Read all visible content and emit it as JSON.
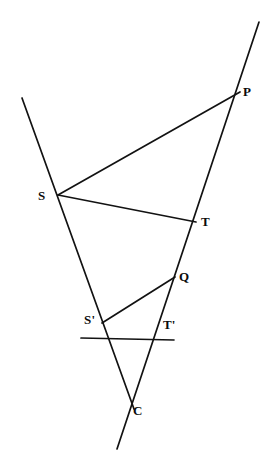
{
  "figure": {
    "background_color": "#ffffff",
    "stroke_color": "#121212",
    "label_color": "#0b0b0b",
    "width": 275,
    "height": 465
  },
  "labels": [
    {
      "id": "P",
      "text": "P",
      "x": 243,
      "y": 85,
      "anchor_x": 240,
      "anchor_y": 92
    },
    {
      "id": "S",
      "text": "S",
      "x": 38,
      "y": 189,
      "anchor_x": 58,
      "anchor_y": 195
    },
    {
      "id": "T",
      "text": "T",
      "x": 201,
      "y": 215,
      "anchor_x": 196,
      "anchor_y": 222
    },
    {
      "id": "Q",
      "text": "Q",
      "x": 179,
      "y": 270,
      "anchor_x": 175,
      "anchor_y": 277
    },
    {
      "id": "Sp",
      "text": "S'",
      "x": 84,
      "y": 313,
      "anchor_x": 102,
      "anchor_y": 323
    },
    {
      "id": "Tp",
      "text": "T'",
      "x": 163,
      "y": 318,
      "anchor_x": 158,
      "anchor_y": 331
    },
    {
      "id": "C",
      "text": "C",
      "x": 133,
      "y": 404,
      "anchor_x": 130,
      "anchor_y": 400
    }
  ],
  "points": {
    "P": {
      "x": 240,
      "y": 92
    },
    "S": {
      "x": 58,
      "y": 195
    },
    "T": {
      "x": 196,
      "y": 222
    },
    "Q": {
      "x": 175,
      "y": 277
    },
    "Sp": {
      "x": 102,
      "y": 323
    },
    "Tp": {
      "x": 158,
      "y": 331
    },
    "C": {
      "x": 130,
      "y": 400
    }
  },
  "lines": [
    {
      "id": "line-s-transversal",
      "name": "transversal-through-S-Sprime-C",
      "from": {
        "x": 22,
        "y": 98
      },
      "to": {
        "x": 134,
        "y": 409
      },
      "passes_through": [
        "S",
        "Sp",
        "C"
      ]
    },
    {
      "id": "line-p-transversal",
      "name": "transversal-through-P-T-Q-Tprime-C",
      "from": {
        "x": 259,
        "y": 22
      },
      "to": {
        "x": 117,
        "y": 449
      },
      "passes_through": [
        "P",
        "T",
        "Q",
        "Tp",
        "C"
      ]
    },
    {
      "id": "line-sprime-tprime",
      "name": "line-through-Sprime-and-Tprime",
      "from": {
        "x": 81,
        "y": 338
      },
      "to": {
        "x": 174,
        "y": 340
      },
      "passes_through": [
        "Sp",
        "Tp"
      ]
    }
  ],
  "segments": [
    {
      "id": "segment-s-p",
      "name": "segment-S-to-P",
      "from": {
        "x": 58,
        "y": 195
      },
      "to": {
        "x": 240,
        "y": 92
      }
    },
    {
      "id": "segment-s-t",
      "name": "segment-S-to-T",
      "from": {
        "x": 58,
        "y": 195
      },
      "to": {
        "x": 196,
        "y": 222
      }
    },
    {
      "id": "segment-sprime-q",
      "name": "segment-Sprime-to-Q",
      "from": {
        "x": 102,
        "y": 323
      },
      "to": {
        "x": 175,
        "y": 277
      }
    }
  ]
}
